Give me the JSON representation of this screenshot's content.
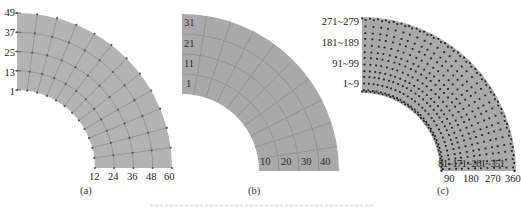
{
  "figure": {
    "colors": {
      "fan_fill_a": "#b3b3b3",
      "fan_fill_bc": "#a9a9a9",
      "grid_line": "#8e8e8e",
      "node_dot": "#555555",
      "dot_c": "#1e1e1e",
      "text": "#222222"
    },
    "panels": [
      {
        "id": "a",
        "caption": "(a)",
        "left_labels": [
          "49",
          "37",
          "25",
          "13",
          "1"
        ],
        "bottom_labels": [
          "12",
          "24",
          "36",
          "48",
          "60"
        ],
        "geometry": {
          "cx": 17,
          "cy": 168,
          "r_inner": 78,
          "r_outer": 155,
          "radial_rings": 4,
          "angular_segments": 12
        },
        "style": "mesh-with-nodes"
      },
      {
        "id": "b",
        "caption": "(b)",
        "left_labels": [
          "31",
          "21",
          "11",
          "1"
        ],
        "bottom_labels": [
          "10",
          "20",
          "30",
          "40"
        ],
        "geometry": {
          "cx": 182,
          "cy": 171,
          "r_inner": 77,
          "r_outer": 157,
          "radial_rings": 4,
          "angular_segments": 10
        },
        "style": "element-mesh"
      },
      {
        "id": "c",
        "caption": "(c)",
        "left_labels": [
          "271~279",
          "181~189",
          "91~99",
          "1~9"
        ],
        "bottom_inside_label": "81~171~261~351",
        "bottom_labels": [
          "90",
          "180",
          "270",
          "360"
        ],
        "geometry": {
          "cx": 362,
          "cy": 171,
          "r_inner": 78,
          "r_outer": 154,
          "radial_rings": 4,
          "angular_segments": 10
        },
        "style": "gauss-points"
      }
    ]
  }
}
